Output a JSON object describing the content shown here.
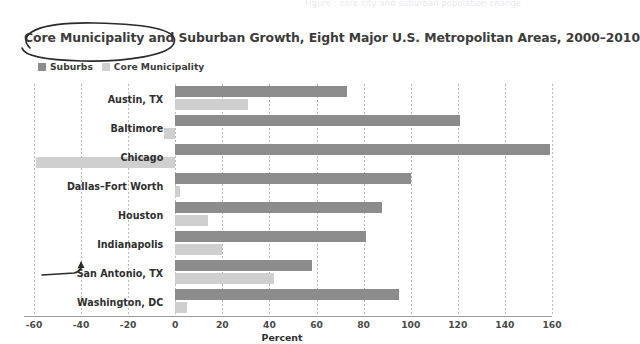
{
  "faint_header": "Figure · core city and suburban population change",
  "title": "Core Municipality and Suburban Growth, Eight Major U.S. Metropolitan Areas, 2000–2010",
  "legend": {
    "position": "top-left",
    "items": [
      {
        "label": "Suburbs",
        "color": "#8c8c8c",
        "name": "suburbs"
      },
      {
        "label": "Core Municipality",
        "color": "#cfcfcf",
        "name": "core-municipality"
      }
    ]
  },
  "annotations": [
    {
      "type": "ellipse",
      "target": "chart-title",
      "name": "title-circle-annotation"
    },
    {
      "type": "arrow",
      "target": "san-antonio-row",
      "name": "san-antonio-arrow-annotation"
    }
  ],
  "chart_data": {
    "type": "bar",
    "orientation": "horizontal",
    "title": "Core Municipality and Suburban Growth, Eight Major U.S. Metropolitan Areas, 2000–2010",
    "xlabel": "Percent",
    "ylabel": "",
    "xlim": [
      -60,
      160
    ],
    "xticks": [
      -60,
      -40,
      -20,
      0,
      20,
      40,
      60,
      80,
      100,
      120,
      140,
      160
    ],
    "xtick_labels": [
      "-60",
      "-40",
      "-20",
      "0",
      "20",
      "40",
      "60",
      "80",
      "100",
      "120",
      "140",
      "160"
    ],
    "grid": true,
    "grid_axis": "x",
    "legend_position": "top-left",
    "categories": [
      "Austin, TX",
      "Baltimore",
      "Chicago",
      "Dallas–Fort Worth",
      "Houston",
      "Indianapolis",
      "San Antonio, TX",
      "Washington, DC"
    ],
    "series": [
      {
        "name": "Suburbs",
        "color": "#8c8c8c",
        "values": [
          73,
          121,
          159,
          100,
          88,
          81,
          58,
          95
        ]
      },
      {
        "name": "Core Municipality",
        "color": "#cfcfcf",
        "values": [
          31,
          -5,
          -59,
          2,
          14,
          20,
          42,
          5
        ]
      }
    ]
  }
}
